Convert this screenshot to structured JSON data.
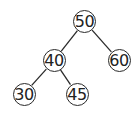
{
  "diagram": {
    "type": "binary-search-tree",
    "line_color": "#2a2a2a",
    "node_radius": 11.5,
    "font_size": 16,
    "nodes": [
      {
        "id": "n50",
        "label": "50",
        "x": 84.5,
        "y": 21.5
      },
      {
        "id": "n40",
        "label": "40",
        "x": 54,
        "y": 60.5
      },
      {
        "id": "n60",
        "label": "60",
        "x": 119,
        "y": 60.5
      },
      {
        "id": "n30",
        "label": "30",
        "x": 24,
        "y": 94
      },
      {
        "id": "n45",
        "label": "45",
        "x": 77,
        "y": 94
      }
    ],
    "edges": [
      {
        "from": "n50",
        "to": "n40"
      },
      {
        "from": "n50",
        "to": "n60"
      },
      {
        "from": "n40",
        "to": "n30"
      },
      {
        "from": "n40",
        "to": "n45"
      }
    ]
  }
}
